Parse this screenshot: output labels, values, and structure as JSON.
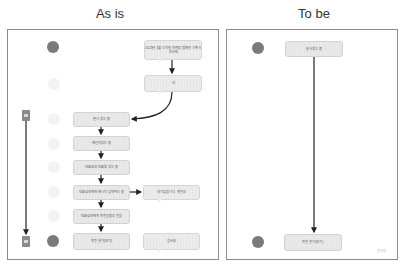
{
  "titles": {
    "as_is": "As is",
    "to_be": "To be"
  },
  "as_is": {
    "bubbles": [
      {
        "id": "b1",
        "text": "2023년 3월 디지털 마케팅 캠페인 기획서 보내줘"
      },
      {
        "id": "b2",
        "text": "네"
      },
      {
        "id": "b3",
        "text": "여기있습니다. 확인요"
      },
      {
        "id": "b4",
        "text": "감사요"
      }
    ],
    "steps": [
      {
        "id": "s1",
        "text": "문서 찾는 중"
      },
      {
        "id": "s2",
        "text": "메신저 찾는 중"
      },
      {
        "id": "s3",
        "text": "대화상대 대화방 찾는 중"
      },
      {
        "id": "s4",
        "text": "대화상대에게 메시지 입력하는 중"
      },
      {
        "id": "s5",
        "text": "대화상대에게 파일을 첨부 전송"
      },
      {
        "id": "s6",
        "text": "파일 열기(보기)"
      }
    ],
    "avatars": [
      {
        "role": "requester",
        "style": "dark"
      },
      {
        "role": "worker",
        "style": "light"
      },
      {
        "role": "worker",
        "style": "light"
      },
      {
        "role": "worker",
        "style": "light"
      },
      {
        "role": "worker",
        "style": "light"
      },
      {
        "role": "worker",
        "style": "light"
      },
      {
        "role": "worker",
        "style": "light"
      },
      {
        "role": "requester",
        "style": "dark"
      }
    ],
    "documents": [
      "source-document",
      "received-document"
    ]
  },
  "to_be": {
    "steps": [
      {
        "id": "t1",
        "text": "문서 찾는 중"
      },
      {
        "id": "t2",
        "text": "파일 열기(보기)"
      }
    ],
    "avatars": [
      {
        "role": "user",
        "style": "dark"
      },
      {
        "role": "user",
        "style": "dark"
      }
    ],
    "footer_note": "원더링"
  },
  "colors": {
    "frame": "#8c8c8c",
    "box": "#e9e9e9",
    "arrow": "#222222",
    "avatar_dark": "#7a7a7a"
  }
}
